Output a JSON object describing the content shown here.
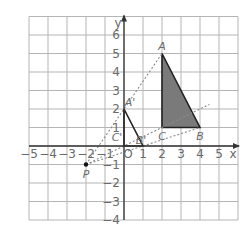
{
  "diagram": {
    "type": "coordinate-grid-dilation",
    "axes": {
      "x_label": "x",
      "y_label": "y",
      "origin_label": "O",
      "x_range": [
        -5,
        6
      ],
      "y_range": [
        -4,
        7
      ],
      "x_ticks": [
        "-5",
        "-4",
        "-3",
        "-2",
        "-1",
        "1",
        "2",
        "3",
        "4",
        "5"
      ],
      "y_ticks": [
        "6",
        "5",
        "4",
        "3",
        "2",
        "1",
        "-1",
        "-2",
        "-3",
        "-4"
      ]
    },
    "triangle_original": {
      "name": "ABC",
      "fill": "#7a7a7a",
      "points": [
        {
          "label": "A",
          "x": 2,
          "y": 5
        },
        {
          "label": "B",
          "x": 4,
          "y": 1
        },
        {
          "label": "C",
          "x": 2,
          "y": 1
        }
      ]
    },
    "triangle_image": {
      "name": "A'B'C'",
      "points": [
        {
          "label": "A'",
          "x": 0,
          "y": 2
        },
        {
          "label": "B'",
          "x": 1,
          "y": 0
        },
        {
          "label": "C'",
          "x": 0,
          "y": 0
        }
      ]
    },
    "center": {
      "label": "P",
      "x": -2,
      "y": -1
    },
    "rays": [
      {
        "from": "P",
        "through": "A'",
        "to": "A"
      },
      {
        "from": "P",
        "through": "B'",
        "to": "B"
      },
      {
        "from": "P",
        "through": "C'",
        "to": "C",
        "extends_to": [
          4.5,
          2.25
        ]
      }
    ],
    "colors": {
      "grid": "#b5b5b5",
      "axis": "#333333",
      "shade": "#7a7a7a",
      "dashed": "#8a8a8a",
      "text": "#6a6a6a"
    }
  }
}
